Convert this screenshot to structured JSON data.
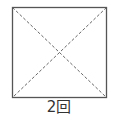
{
  "diagram": {
    "shape": "square",
    "square": {
      "x": 12,
      "y": 7,
      "width": 94,
      "height": 90
    },
    "border_color": "#555555",
    "diagonal_color": "#666666",
    "diagonals": [
      {
        "from": "top-left",
        "to": "bottom-right",
        "style": "dashed"
      },
      {
        "from": "top-right",
        "to": "bottom-left",
        "style": "dashed"
      }
    ],
    "label": "2回"
  }
}
